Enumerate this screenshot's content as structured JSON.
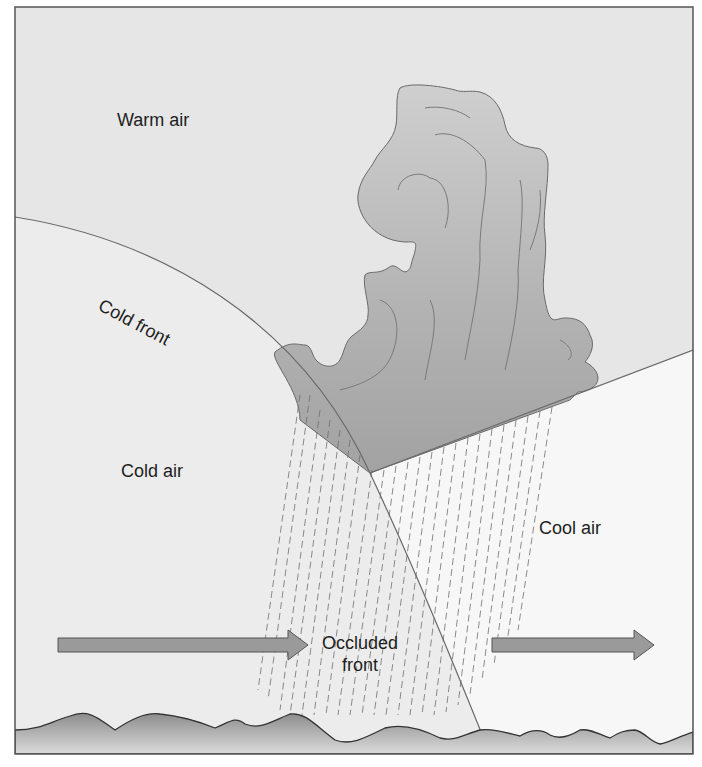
{
  "diagram": {
    "labels": {
      "warm_air": "Warm air",
      "cold_front": "Cold front",
      "cold_air": "Cold air",
      "cool_air": "Cool air",
      "occluded_line1": "Occluded",
      "occluded_line2": "front"
    },
    "colors": {
      "warm_air_bg": "#e6e6e6",
      "cold_air_bg": "#ececec",
      "cool_air_bg": "#f6f6f6",
      "cloud_fill": "#a9a9a9",
      "arrow_fill": "#9a9a9a",
      "ground_fill": "#a6a6a6",
      "frame": "#555555"
    },
    "elements": [
      {
        "name": "cloud",
        "type": "cumulonimbus-cloud"
      },
      {
        "name": "rain",
        "type": "dashed-precipitation-lines"
      },
      {
        "name": "left-arrow",
        "type": "flow-arrow",
        "direction": "right"
      },
      {
        "name": "right-arrow",
        "type": "flow-arrow",
        "direction": "right"
      },
      {
        "name": "ground",
        "type": "wavy-terrain"
      }
    ]
  }
}
